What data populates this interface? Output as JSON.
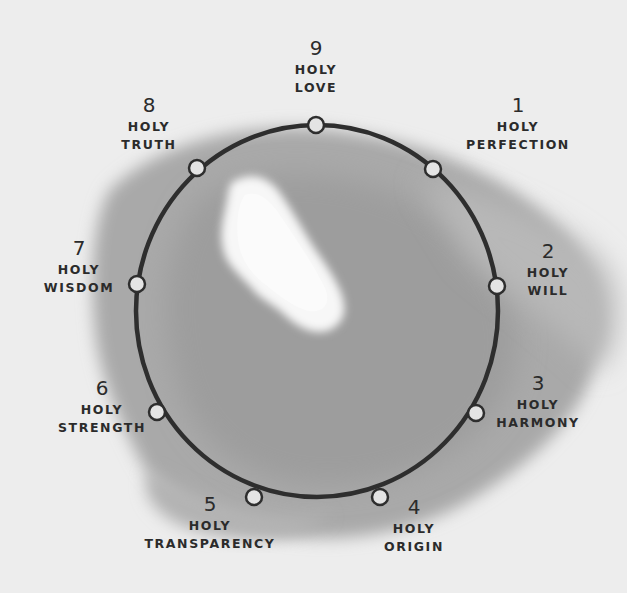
{
  "diagram": {
    "type": "enneagram-ring",
    "colors": {
      "paper": "#ededed",
      "wash": "#a8a8a8",
      "wash_dark": "#999999",
      "highlight": "#f6f6f6",
      "ring_stroke": "#2e2e2e",
      "node_fill": "#e6e6e6",
      "text": "#2b2b2b"
    },
    "nodes": [
      {
        "number": "9",
        "line1": "HOLY",
        "line2": "LOVE"
      },
      {
        "number": "1",
        "line1": "HOLY",
        "line2": "PERFECTION"
      },
      {
        "number": "2",
        "line1": "HOLY",
        "line2": "WILL"
      },
      {
        "number": "3",
        "line1": "HOLY",
        "line2": "HARMONY"
      },
      {
        "number": "4",
        "line1": "HOLY",
        "line2": "ORIGIN"
      },
      {
        "number": "5",
        "line1": "HOLY",
        "line2": "TRANSPARENCY"
      },
      {
        "number": "6",
        "line1": "HOLY",
        "line2": "STRENGTH"
      },
      {
        "number": "7",
        "line1": "HOLY",
        "line2": "WISDOM"
      },
      {
        "number": "8",
        "line1": "HOLY",
        "line2": "TRUTH"
      }
    ]
  }
}
